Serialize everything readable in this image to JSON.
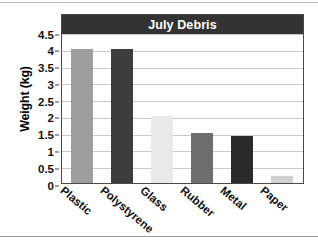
{
  "chart_data": {
    "type": "bar",
    "title": "July Debris",
    "xlabel": "",
    "ylabel": "Weight (kg)",
    "categories": [
      "Plastic",
      "Polystyrene",
      "Glass",
      "Rubber",
      "Metal",
      "Paper"
    ],
    "values": [
      4,
      4,
      2,
      1.5,
      1.4,
      0.2
    ],
    "bar_colors": [
      "#9e9e9e",
      "#3d3d3d",
      "#e9e9e9",
      "#6e6e6e",
      "#2b2b2b",
      "#d0d0d0"
    ],
    "ylim": [
      0,
      4.5
    ],
    "ytick_labels": [
      "0",
      "0.5",
      "1",
      "1.5",
      "2",
      "2.5",
      "3",
      "3.5",
      "4",
      "4.5"
    ],
    "ytick_values": [
      0,
      0.5,
      1,
      1.5,
      2,
      2.5,
      3,
      3.5,
      4,
      4.5
    ],
    "grid": true,
    "legend": "none",
    "title_bar_color": "#333333",
    "title_text_color": "#ffffff",
    "gridline_color": "#c9c9c9",
    "frame_color": "#4a4a4a",
    "plot_background": "#ffffff"
  }
}
